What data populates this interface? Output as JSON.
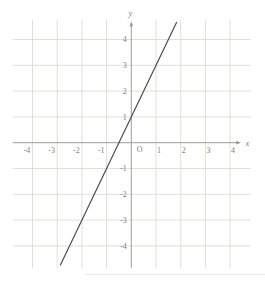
{
  "chart_data": {
    "type": "line",
    "title": "",
    "xlabel": "x",
    "ylabel": "y",
    "origin_label": "O",
    "x_ticks": [
      -4,
      -3,
      -2,
      -1,
      1,
      2,
      3,
      4
    ],
    "y_ticks": [
      -4,
      -3,
      -2,
      -1,
      1,
      2,
      3,
      4
    ],
    "xlim": [
      -4.8,
      4.85
    ],
    "ylim": [
      -4.85,
      4.75
    ],
    "grid": true,
    "legend": "none",
    "series": [
      {
        "name": "plotted-line",
        "equation": "y = 2x + 1",
        "slope": 2,
        "intercept": 1,
        "x_intercept": -0.5,
        "y_intercept": 1,
        "points": [
          [
            -2.87,
            -4.74
          ],
          [
            1.83,
            4.66
          ]
        ]
      }
    ],
    "colors": {
      "background": "#ffffff",
      "grid": "#dde1da",
      "axis": "#9c9c98",
      "labels": "#837e78",
      "line": "#4d4d4d"
    }
  }
}
